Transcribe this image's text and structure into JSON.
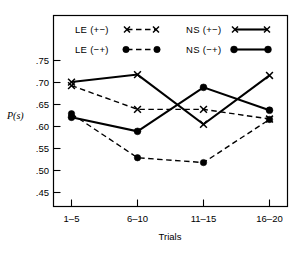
{
  "chart_data": {
    "type": "line",
    "title": "",
    "xlabel": "Trials",
    "ylabel": "P(s)",
    "ylabel_main": "P",
    "ylabel_paren": "(s)",
    "categories": [
      "1–5",
      "6–10",
      "11–15",
      "16–20"
    ],
    "ytick_labels": [
      ".75",
      ".70",
      ".65",
      ".60",
      ".55",
      ".50",
      ".45"
    ],
    "ytick_values": [
      0.75,
      0.7,
      0.65,
      0.6,
      0.55,
      0.5,
      0.45
    ],
    "ylim": [
      0.425,
      0.775
    ],
    "grid": false,
    "legend_position": "inside-top",
    "series": [
      {
        "name": "LE (+−)",
        "marker": "x",
        "line": "dashed",
        "values": [
          0.693,
          0.639,
          0.639,
          0.617
        ]
      },
      {
        "name": "LE (−+)",
        "marker": "circle",
        "line": "dashed",
        "values": [
          0.629,
          0.529,
          0.518,
          0.616
        ]
      },
      {
        "name": "NS (+−)",
        "marker": "x",
        "line": "solid",
        "values": [
          0.701,
          0.718,
          0.605,
          0.716
        ]
      },
      {
        "name": "NS (−+)",
        "marker": "circle",
        "line": "solid",
        "values": [
          0.621,
          0.589,
          0.689,
          0.637
        ]
      }
    ]
  },
  "legend": {
    "items": [
      {
        "label": "LE (+−)",
        "marker": "x-marker",
        "line": "dashed"
      },
      {
        "label": "NS (+−)",
        "marker": "x-marker",
        "line": "solid"
      },
      {
        "label": "LE (−+)",
        "marker": "dot-marker",
        "line": "dashed"
      },
      {
        "label": "NS (−+)",
        "marker": "dot-marker",
        "line": "solid"
      }
    ]
  },
  "colors": {
    "ink": "#000000",
    "background": "#ffffff"
  }
}
